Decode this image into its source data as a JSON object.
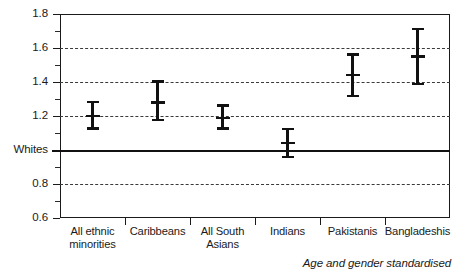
{
  "chart_data": {
    "type": "scatter",
    "title": "",
    "subtitle": "",
    "xlabel": "",
    "ylabel": "",
    "caption": "Age and gender standardised",
    "ylim": [
      0.6,
      1.8
    ],
    "yticks": [
      {
        "value": 1.8,
        "label": "1.8",
        "grid": false,
        "major": true
      },
      {
        "value": 1.7,
        "label": "",
        "grid": false,
        "major": false
      },
      {
        "value": 1.6,
        "label": "1.6",
        "grid": true,
        "major": true
      },
      {
        "value": 1.5,
        "label": "",
        "grid": false,
        "major": false
      },
      {
        "value": 1.4,
        "label": "1.4",
        "grid": true,
        "major": true
      },
      {
        "value": 1.3,
        "label": "",
        "grid": false,
        "major": false
      },
      {
        "value": 1.2,
        "label": "1.2",
        "grid": true,
        "major": true
      },
      {
        "value": 1.1,
        "label": "",
        "grid": false,
        "major": false
      },
      {
        "value": 1.0,
        "label": "Whites",
        "grid": false,
        "major": true
      },
      {
        "value": 0.9,
        "label": "",
        "grid": false,
        "major": false
      },
      {
        "value": 0.8,
        "label": "0.8",
        "grid": true,
        "major": true
      },
      {
        "value": 0.7,
        "label": "",
        "grid": false,
        "major": false
      },
      {
        "value": 0.6,
        "label": "0.6",
        "grid": false,
        "major": true
      }
    ],
    "reference_line": {
      "value": 1.0,
      "label": "Whites"
    },
    "grid": true,
    "legend": "none",
    "categories": [
      "All ethnic\nminorities",
      "Caribbeans",
      "All South\nAsians",
      "Indians",
      "Pakistanis",
      "Bangladeshis"
    ],
    "values": [
      1.2,
      1.28,
      1.19,
      1.04,
      1.44,
      1.55
    ],
    "ci_low": [
      1.12,
      1.17,
      1.12,
      0.95,
      1.31,
      1.38
    ],
    "ci_high": [
      1.29,
      1.41,
      1.27,
      1.13,
      1.57,
      1.72
    ],
    "series": [
      {
        "name": "Ratio vs Whites",
        "points": [
          {
            "category": "All ethnic minorities",
            "value": 1.2,
            "low": 1.12,
            "high": 1.29
          },
          {
            "category": "Caribbeans",
            "value": 1.28,
            "low": 1.17,
            "high": 1.41
          },
          {
            "category": "All South Asians",
            "value": 1.19,
            "low": 1.12,
            "high": 1.27
          },
          {
            "category": "Indians",
            "value": 1.04,
            "low": 0.95,
            "high": 1.13
          },
          {
            "category": "Pakistanis",
            "value": 1.44,
            "low": 1.31,
            "high": 1.57
          },
          {
            "category": "Bangladeshis",
            "value": 1.55,
            "low": 1.38,
            "high": 1.72
          }
        ]
      }
    ],
    "colors": {
      "marker": "#111111",
      "grid": "#3a3a3a",
      "axis": "#1a1a1a",
      "reference": "#111111"
    }
  }
}
